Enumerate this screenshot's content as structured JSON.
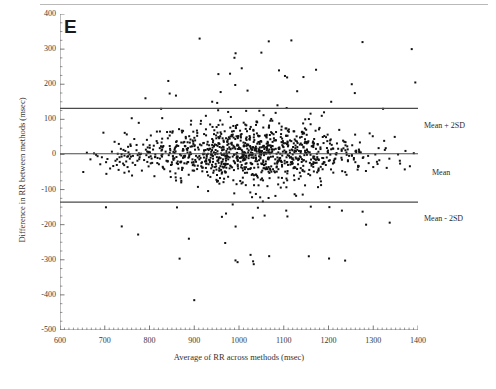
{
  "figure": {
    "panel_letter": "E"
  },
  "axes": {
    "x": {
      "label": "Average of RR across methods (msec)",
      "ticks": [
        600,
        700,
        800,
        900,
        1000,
        1100,
        1200,
        1300,
        1400
      ],
      "min": 600,
      "max": 1400,
      "minor_per_major": 10
    },
    "y": {
      "label": "Difference in RR between methods (msec)",
      "ticks": [
        400,
        300,
        200,
        100,
        0,
        -100,
        -200,
        -300,
        -400,
        -500
      ],
      "min": -500,
      "max": 400,
      "minor_per_major": 4
    }
  },
  "reference_lines": {
    "upper": {
      "label": "Mean + 2SD",
      "value": 131
    },
    "mean": {
      "label": "Mean",
      "value": 2
    },
    "lower": {
      "label": "Mean - 2SD",
      "value": -136
    }
  },
  "colors": {
    "point": "#111111",
    "reference_line": "#4a4a4a",
    "axis": "#6b6b6b",
    "text": "#2b2b2b",
    "background": "#ffffff"
  },
  "chart_data": {
    "type": "scatter",
    "title": "",
    "subtitle": "",
    "xlabel": "Average of RR across methods (msec)",
    "ylabel": "Difference in RR between methods (msec)",
    "xlim": [
      600,
      1400
    ],
    "ylim": [
      -500,
      400
    ],
    "grid": false,
    "legend": null,
    "annotations": [
      {
        "text": "E",
        "position": "top-left",
        "role": "panel-letter"
      },
      {
        "text": "Mean + 2SD",
        "y": 131,
        "position": "right"
      },
      {
        "text": "Mean",
        "y": 2,
        "position": "right"
      },
      {
        "text": "Mean - 2SD",
        "y": -136,
        "position": "right"
      }
    ],
    "hlines": [
      {
        "name": "Mean + 2SD",
        "y": 131
      },
      {
        "name": "Mean",
        "y": 2
      },
      {
        "name": "Mean - 2SD",
        "y": -136
      }
    ],
    "marker": {
      "shape": "square",
      "size": 2,
      "color": "#111111"
    },
    "n_points": 1180,
    "series": [
      {
        "name": "RR difference",
        "description": "Bland-Altman scatter of RR interval differences vs average RR; dense band around mean with heteroscedastic spread widening between 900 and 1200 msec.",
        "density_model": {
          "x_distribution": "normal-ish centered near 1020 msec, sd approx 130, clipped to [640, 1400]",
          "y_core_sd": 38,
          "y_tail_fraction": 0.12,
          "y_tail_sd": 150
        },
        "points": [
          [
            652,
            -50
          ],
          [
            660,
            5
          ],
          [
            668,
            -14
          ],
          [
            676,
            3
          ],
          [
            684,
            -5
          ],
          [
            690,
            -28
          ],
          [
            697,
            62
          ],
          [
            703,
            -22
          ],
          [
            706,
            -13
          ],
          [
            712,
            -40
          ],
          [
            716,
            8
          ],
          [
            719,
            -33
          ],
          [
            722,
            36
          ],
          [
            724,
            -18
          ],
          [
            727,
            -30
          ],
          [
            729,
            2
          ],
          [
            731,
            -44
          ],
          [
            733,
            -8
          ],
          [
            736,
            16
          ],
          [
            738,
            -205
          ],
          [
            741,
            -26
          ],
          [
            744,
            -52
          ],
          [
            746,
            10
          ],
          [
            748,
            -20
          ],
          [
            751,
            -36
          ],
          [
            753,
            6
          ],
          [
            756,
            -12
          ],
          [
            758,
            24
          ],
          [
            761,
            -60
          ],
          [
            763,
            -4
          ],
          [
            766,
            44
          ],
          [
            768,
            -30
          ],
          [
            771,
            12
          ],
          [
            773,
            -18
          ],
          [
            776,
            90
          ],
          [
            778,
            -8
          ],
          [
            781,
            2
          ],
          [
            783,
            -46
          ],
          [
            786,
            28
          ],
          [
            788,
            -16
          ],
          [
            791,
            160
          ],
          [
            793,
            -2
          ],
          [
            796,
            20
          ],
          [
            798,
            -34
          ],
          [
            801,
            6
          ],
          [
            803,
            54
          ],
          [
            806,
            -24
          ],
          [
            808,
            14
          ],
          [
            811,
            -62
          ],
          [
            813,
            0
          ],
          [
            816,
            38
          ],
          [
            818,
            -10
          ],
          [
            821,
            -28
          ],
          [
            823,
            18
          ],
          [
            826,
            130
          ],
          [
            828,
            -6
          ],
          [
            831,
            24
          ],
          [
            833,
            -42
          ],
          [
            836,
            8
          ],
          [
            838,
            -18
          ],
          [
            841,
            46
          ],
          [
            843,
            -2
          ],
          [
            846,
            16
          ],
          [
            848,
            -30
          ],
          [
            851,
            62
          ],
          [
            853,
            -12
          ],
          [
            856,
            4
          ],
          [
            858,
            -54
          ],
          [
            861,
            26
          ],
          [
            863,
            -20
          ],
          [
            866,
            72
          ],
          [
            868,
            0
          ],
          [
            871,
            34
          ],
          [
            873,
            -38
          ],
          [
            876,
            12
          ],
          [
            878,
            -8
          ],
          [
            881,
            50
          ],
          [
            883,
            -26
          ],
          [
            886,
            18
          ],
          [
            888,
            -240
          ],
          [
            891,
            6
          ],
          [
            893,
            96
          ],
          [
            896,
            -14
          ],
          [
            898,
            30
          ],
          [
            900,
            -415
          ],
          [
            902,
            40
          ],
          [
            904,
            -4
          ],
          [
            906,
            68
          ],
          [
            908,
            -32
          ],
          [
            910,
            14
          ],
          [
            912,
            330
          ],
          [
            914,
            -10
          ],
          [
            916,
            26
          ],
          [
            918,
            -48
          ],
          [
            920,
            2
          ],
          [
            922,
            58
          ],
          [
            924,
            -20
          ],
          [
            926,
            110
          ],
          [
            928,
            -6
          ],
          [
            930,
            36
          ],
          [
            932,
            -28
          ],
          [
            934,
            16
          ],
          [
            936,
            -64
          ],
          [
            938,
            8
          ],
          [
            940,
            44
          ],
          [
            942,
            -12
          ],
          [
            944,
            24
          ],
          [
            946,
            -36
          ],
          [
            948,
            4
          ],
          [
            950,
            78
          ],
          [
            952,
            -18
          ],
          [
            954,
            32
          ],
          [
            956,
            -8
          ],
          [
            958,
            52
          ],
          [
            960,
            -44
          ],
          [
            962,
            12
          ],
          [
            964,
            22
          ],
          [
            966,
            -2
          ],
          [
            968,
            66
          ],
          [
            970,
            -26
          ],
          [
            972,
            10
          ],
          [
            974,
            38
          ],
          [
            976,
            -14
          ],
          [
            978,
            6
          ],
          [
            980,
            230
          ],
          [
            982,
            -34
          ],
          [
            984,
            28
          ],
          [
            986,
            -6
          ],
          [
            988,
            48
          ],
          [
            990,
            -22
          ],
          [
            992,
            16
          ],
          [
            994,
            2
          ],
          [
            996,
            84
          ],
          [
            998,
            -40
          ],
          [
            1000,
            20
          ],
          [
            1002,
            -10
          ],
          [
            1004,
            56
          ],
          [
            1006,
            -30
          ],
          [
            1008,
            8
          ],
          [
            1010,
            34
          ],
          [
            1012,
            -16
          ],
          [
            1014,
            4
          ],
          [
            1016,
            124
          ],
          [
            1018,
            -52
          ],
          [
            1020,
            26
          ],
          [
            1022,
            -4
          ],
          [
            1024,
            42
          ],
          [
            1026,
            -24
          ],
          [
            1028,
            14
          ],
          [
            1030,
            0
          ],
          [
            1032,
            70
          ],
          [
            1034,
            -38
          ],
          [
            1036,
            18
          ],
          [
            1038,
            -12
          ],
          [
            1040,
            60
          ],
          [
            1042,
            -28
          ],
          [
            1044,
            10
          ],
          [
            1046,
            30
          ],
          [
            1048,
            -8
          ],
          [
            1050,
            290
          ],
          [
            1052,
            -46
          ],
          [
            1054,
            22
          ],
          [
            1056,
            -2
          ],
          [
            1058,
            54
          ],
          [
            1060,
            -20
          ],
          [
            1062,
            12
          ],
          [
            1064,
            36
          ],
          [
            1066,
            -14
          ],
          [
            1068,
            6
          ],
          [
            1070,
            96
          ],
          [
            1072,
            -34
          ],
          [
            1074,
            24
          ],
          [
            1076,
            -6
          ],
          [
            1078,
            46
          ],
          [
            1080,
            -26
          ],
          [
            1082,
            16
          ],
          [
            1084,
            2
          ],
          [
            1086,
            140
          ],
          [
            1088,
            -42
          ],
          [
            1090,
            20
          ],
          [
            1092,
            -10
          ],
          [
            1094,
            58
          ],
          [
            1096,
            -30
          ],
          [
            1098,
            8
          ],
          [
            1100,
            32
          ],
          [
            1102,
            -18
          ],
          [
            1104,
            4
          ],
          [
            1106,
            74
          ],
          [
            1108,
            -54
          ],
          [
            1110,
            26
          ],
          [
            1112,
            -4
          ],
          [
            1114,
            40
          ],
          [
            1116,
            -22
          ],
          [
            1118,
            14
          ],
          [
            1120,
            0
          ],
          [
            1122,
            66
          ],
          [
            1124,
            -36
          ],
          [
            1126,
            18
          ],
          [
            1128,
            -12
          ],
          [
            1130,
            180
          ],
          [
            1132,
            -28
          ],
          [
            1134,
            10
          ],
          [
            1136,
            28
          ],
          [
            1138,
            -8
          ],
          [
            1140,
            50
          ],
          [
            1142,
            -44
          ],
          [
            1144,
            22
          ],
          [
            1146,
            -2
          ],
          [
            1148,
            100
          ],
          [
            1150,
            -20
          ],
          [
            1152,
            12
          ],
          [
            1154,
            34
          ],
          [
            1156,
            -290
          ],
          [
            1158,
            6
          ],
          [
            1160,
            86
          ],
          [
            1162,
            -32
          ],
          [
            1164,
            24
          ],
          [
            1166,
            -6
          ],
          [
            1168,
            44
          ],
          [
            1170,
            -24
          ],
          [
            1172,
            16
          ],
          [
            1174,
            2
          ],
          [
            1178,
            -40
          ],
          [
            1182,
            20
          ],
          [
            1186,
            -10
          ],
          [
            1190,
            120
          ],
          [
            1194,
            -30
          ],
          [
            1198,
            8
          ],
          [
            1202,
            -150
          ],
          [
            1206,
            150
          ],
          [
            1212,
            -18
          ],
          [
            1218,
            4
          ],
          [
            1224,
            70
          ],
          [
            1230,
            -160
          ],
          [
            1238,
            26
          ],
          [
            1246,
            -4
          ],
          [
            1252,
            200
          ],
          [
            1260,
            -22
          ],
          [
            1268,
            14
          ],
          [
            1276,
            320
          ],
          [
            1284,
            -200
          ],
          [
            1292,
            60
          ],
          [
            1300,
            -36
          ],
          [
            1312,
            18
          ],
          [
            1322,
            130
          ],
          [
            1336,
            -12
          ],
          [
            1348,
            50
          ],
          [
            1360,
            -26
          ],
          [
            1372,
            10
          ],
          [
            1386,
            300
          ],
          [
            1394,
            205
          ]
        ]
      }
    ]
  }
}
